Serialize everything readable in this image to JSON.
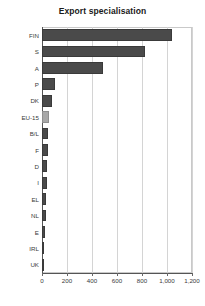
{
  "chart_data": {
    "type": "bar",
    "orientation": "horizontal",
    "title": "Export specialisation",
    "xlabel": "",
    "ylabel": "",
    "categories": [
      "FIN",
      "S",
      "A",
      "P",
      "DK",
      "EU-15",
      "B/L",
      "F",
      "D",
      "I",
      "EL",
      "NL",
      "E",
      "IRL",
      "UK"
    ],
    "values": [
      1040,
      820,
      490,
      105,
      80,
      55,
      50,
      45,
      42,
      38,
      32,
      28,
      25,
      18,
      5
    ],
    "highlight_category": "EU-15",
    "xlim": [
      0,
      1200
    ],
    "xticks": [
      0,
      200,
      400,
      600,
      800,
      1000,
      1200
    ],
    "xtick_labels": [
      "0",
      "200",
      "400",
      "600",
      "800",
      "1,000",
      "1,200"
    ],
    "grid": true,
    "grid_axis": "x",
    "legend": null,
    "colors": {
      "bar": "#4a4a4a",
      "bar_highlight": "#a8a8a8",
      "grid": "#d4d4d4",
      "axis": "#555555",
      "text": "#3a3a3a"
    }
  }
}
